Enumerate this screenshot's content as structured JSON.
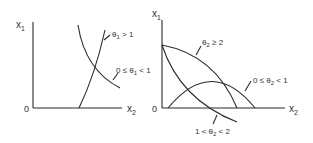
{
  "left_panel": {
    "y_axis_label": "x",
    "y_axis_sub": "1",
    "x_axis_label": "x",
    "x_axis_sub": "2",
    "origin": "0",
    "curves": [
      {
        "label_pre": "θ",
        "label_sub": "1",
        "label_post": " > 1"
      },
      {
        "label_pre": "0 ≤ θ",
        "label_sub": "1",
        "label_post": " < 1"
      }
    ]
  },
  "right_panel": {
    "y_axis_label": "x",
    "y_axis_sub": "1",
    "x_axis_label": "x",
    "x_axis_sub": "2",
    "origin": "0",
    "curves": [
      {
        "label_pre": "θ",
        "label_sub": "2",
        "label_post": " ≥ 2"
      },
      {
        "label_pre": "0 ≤ θ",
        "label_sub": "2",
        "label_post": " < 1"
      },
      {
        "label_pre": "1 < θ",
        "label_sub": "2",
        "label_post": " < 2"
      }
    ]
  },
  "colors": {
    "line": "#2a2a2a",
    "text": "#333333",
    "background": "#ffffff"
  }
}
